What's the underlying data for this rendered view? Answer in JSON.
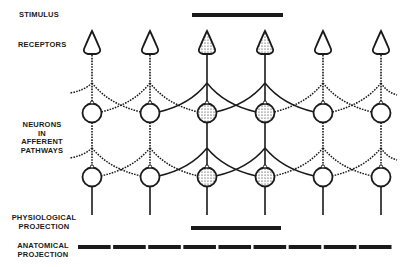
{
  "labels": {
    "stimulus": "STIMULUS",
    "receptors": "RECEPTORS",
    "neurons": [
      "NEURONS",
      "IN",
      "AFFERENT",
      "PATHWAYS"
    ],
    "physiological": [
      "PHYSIOLOGICAL",
      "PROJECTION"
    ],
    "anatomical": [
      "ANATOMICAL",
      "PROJECTION"
    ]
  },
  "diagram": {
    "columns_x": [
      92,
      150,
      207,
      265,
      323,
      381
    ],
    "stimulated_columns": [
      2,
      3
    ],
    "receptor_y": 44,
    "branch_rows_y": [
      83,
      148
    ],
    "neuron_rows_y": [
      113,
      177
    ],
    "stimulus_bar": {
      "x1": 192,
      "x2": 283,
      "y": 15
    },
    "physiological_bar": {
      "x1": 191,
      "x2": 281,
      "y": 228
    },
    "anatomical_segments": 9,
    "anatomical_bar": {
      "x1": 78,
      "x2": 394,
      "y": 247
    },
    "ink_color": "#1a1a1a"
  }
}
